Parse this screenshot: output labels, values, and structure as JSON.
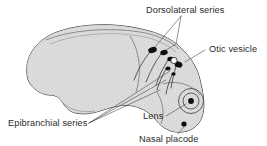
{
  "figure": {
    "background_color": "#ffffff",
    "body_fill": "#dcdcdc",
    "body_outline_color": "#2e2e2e",
    "placode_color": "#0d0d0d",
    "otic_fill": "#ffffff",
    "text_color": "#2b2b2b"
  },
  "labels": {
    "dorsolateral": "Dorsolateral series",
    "otic": "Otic vesicle",
    "epibranchial": "Epibranchial series",
    "lens": "Lens",
    "nasal": "Nasal placode"
  },
  "structures": {
    "dorsolateral_placodes": [
      {
        "cx": 152.5,
        "cy": 50.0,
        "rx": 4.4,
        "ry": 2.9,
        "rot": -18
      },
      {
        "cx": 164.0,
        "cy": 52.5,
        "rx": 3.8,
        "ry": 2.6,
        "rot": -12
      },
      {
        "cx": 170.5,
        "cy": 59.0,
        "rx": 3.2,
        "ry": 2.3,
        "rot": -8
      },
      {
        "cx": 178.5,
        "cy": 64.5,
        "rx": 4.0,
        "ry": 3.0,
        "rot": 20
      },
      {
        "cx": 168.0,
        "cy": 68.5,
        "rx": 2.6,
        "ry": 2.0,
        "rot": 0
      },
      {
        "cx": 173.5,
        "cy": 74.0,
        "rx": 2.2,
        "ry": 1.8,
        "rot": 0
      }
    ],
    "otic_vesicle": {
      "cx": 174.0,
      "cy": 60.5,
      "r": 3.1
    },
    "eye": {
      "cx": 191.0,
      "cy": 101.0,
      "outer_r": 12.5,
      "mid_r": 8.0,
      "lens_r": 2.9
    },
    "nasal_placode": {
      "cx": 184.0,
      "cy": 124.0,
      "r": 2.6
    }
  }
}
